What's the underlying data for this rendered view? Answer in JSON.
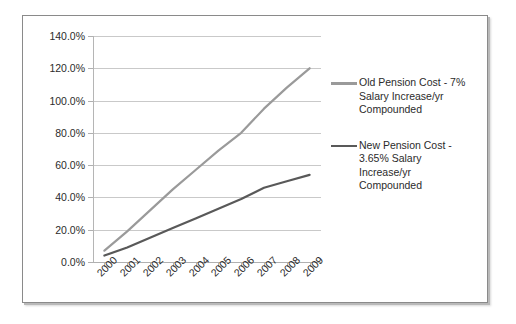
{
  "chart_data": {
    "type": "line",
    "title": "",
    "xlabel": "",
    "ylabel": "",
    "categories": [
      "2000",
      "2001",
      "2002",
      "2003",
      "2004",
      "2005",
      "2006",
      "2007",
      "2008",
      "2009"
    ],
    "ylim": [
      0,
      140
    ],
    "ytick_values": [
      0,
      20,
      40,
      60,
      80,
      100,
      120,
      140
    ],
    "ytick_labels": [
      "0.0%",
      "20.0%",
      "40.0%",
      "60.0%",
      "80.0%",
      "100.0%",
      "120.0%",
      "140.0%"
    ],
    "grid": true,
    "legend_position": "right",
    "series": [
      {
        "name": "Old Pension Cost - 7% Salary Increase/yr Compounded",
        "color": "#9a9a9a",
        "values": [
          7.0,
          19.0,
          32.0,
          45.0,
          57.0,
          69.0,
          80.0,
          95.0,
          108.0,
          120.0
        ]
      },
      {
        "name": "New Pension Cost - 3.65% Salary Increase/yr Compounded",
        "color": "#595959",
        "values": [
          4.0,
          9.0,
          15.0,
          21.0,
          27.0,
          33.0,
          39.0,
          46.0,
          50.0,
          54.0
        ]
      }
    ]
  },
  "legend": {
    "entries": [
      {
        "lines": [
          "Old Pension Cost - 7%",
          "Salary Increase/yr",
          "Compounded"
        ],
        "color": "#9a9a9a"
      },
      {
        "lines": [
          "New Pension Cost -",
          "3.65% Salary",
          "Increase/yr",
          "Compounded"
        ],
        "color": "#595959"
      }
    ]
  }
}
